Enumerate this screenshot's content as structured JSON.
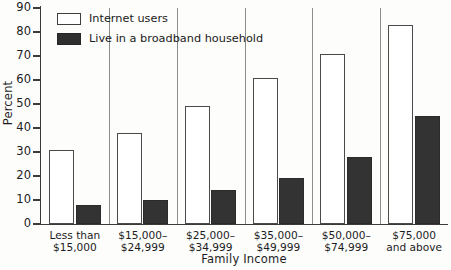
{
  "chart_data": {
    "type": "bar",
    "title": "",
    "subtitle": "",
    "xlabel": "Family Income",
    "ylabel": "Percent",
    "ylim": [
      0,
      90
    ],
    "ytick_step": 10,
    "yticks": [
      "90",
      "80",
      "70",
      "60",
      "50",
      "40",
      "30",
      "20",
      "10",
      "0"
    ],
    "grid": false,
    "legend_position": "top-left-inside",
    "categories": [
      [
        "Less than",
        "$15,000"
      ],
      [
        "$15,000–",
        "$24,999"
      ],
      [
        "$25,000–",
        "$34,999"
      ],
      [
        "$35,000–",
        "$49,999"
      ],
      [
        "$50,000–",
        "$74,999"
      ],
      [
        "$75,000",
        "and above"
      ]
    ],
    "series": [
      {
        "name": "Internet users",
        "style": "open",
        "color": "#ffffff",
        "edge_color": "#4a4a4a",
        "values": [
          31,
          38,
          49,
          61,
          71,
          83
        ]
      },
      {
        "name": "Live in a broadband household",
        "style": "filled",
        "color": "#333333",
        "edge_color": "#2b2b2b",
        "values": [
          8,
          10,
          14,
          19,
          28,
          45
        ]
      }
    ]
  },
  "legend": {
    "items": [
      {
        "label": "Internet users"
      },
      {
        "label": "Live in a broadband household"
      }
    ]
  },
  "axes": {
    "y_title": "Percent",
    "x_title": "Family Income"
  }
}
